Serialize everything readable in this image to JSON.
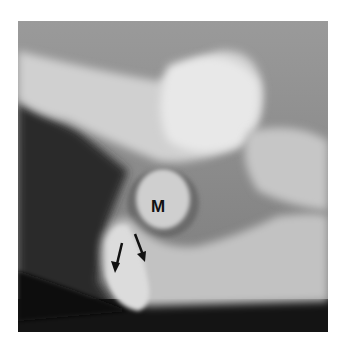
{
  "figure": {
    "type": "radiograph",
    "labels": [
      {
        "text": "M"
      }
    ],
    "arrows": [
      {
        "direction": "down"
      },
      {
        "direction": "down-right"
      }
    ],
    "colors": {
      "background": "#ffffff",
      "bone_light": "#e6e6e6",
      "soft_tissue": "#8a8a8a",
      "dark": "#151515",
      "label": "#111111"
    }
  }
}
